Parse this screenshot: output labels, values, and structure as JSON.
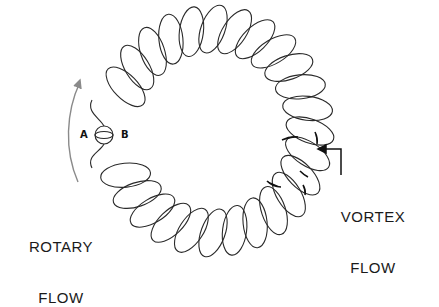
{
  "figure": {
    "type": "toroidal-coil-flow-diagram",
    "labels": {
      "rotary_flow_line1": "ROTARY",
      "rotary_flow_line2": "FLOW",
      "vortex_flow_line1": "VORTEX",
      "vortex_flow_line2": "FLOW",
      "point_a": "A",
      "point_b": "B"
    },
    "coil": {
      "center_x": 213,
      "center_y": 131,
      "ring_radius": 97,
      "loop_count": 28,
      "loop_rx": 12,
      "loop_ry": 25,
      "gap_center_deg": 180,
      "gap_half_width_deg": 14,
      "stroke": "#2a2a2a"
    },
    "rotary_arrow": {
      "color": "#8a8a8a",
      "direction": "counterclockwise-up"
    },
    "vortex_arrow": {
      "color": "#111111",
      "direction": "points-left-into-coil"
    }
  }
}
